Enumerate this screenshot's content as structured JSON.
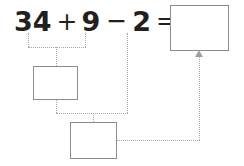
{
  "worksheet": {
    "title": "Number bond decomposition worksheet",
    "equation": {
      "term1": "34",
      "op1": "+",
      "term2": "9",
      "op2": "−",
      "term3": "2",
      "op3": "=",
      "full_text": "34 + 9 − 2 ="
    },
    "boxes": [
      {
        "id": "box-answer",
        "role": "final-answer",
        "value": "",
        "placeholder": ""
      },
      {
        "id": "box-mid",
        "role": "partial-sum-34-plus-9",
        "value": "",
        "placeholder": ""
      },
      {
        "id": "box-bottom",
        "role": "partial-result-minus-2",
        "value": "",
        "placeholder": ""
      }
    ],
    "connectors": [
      {
        "id": "lead-34",
        "from": "term-34",
        "to": "join-top"
      },
      {
        "id": "lead-9",
        "from": "term-9",
        "to": "join-top"
      },
      {
        "id": "join-top",
        "from": "lead-34",
        "to": "lead-9"
      },
      {
        "id": "into-mid",
        "from": "join-top",
        "to": "box-mid"
      },
      {
        "id": "lead-2",
        "from": "term-2",
        "to": "join-mid"
      },
      {
        "id": "mid-down",
        "from": "box-mid",
        "to": "join-mid"
      },
      {
        "id": "join-mid",
        "from": "mid-down",
        "to": "lead-2"
      },
      {
        "id": "into-bottom",
        "from": "join-mid",
        "to": "box-bottom"
      },
      {
        "id": "out-bottom",
        "from": "box-bottom",
        "to": "riser"
      },
      {
        "id": "riser",
        "from": "out-bottom",
        "to": "box-answer"
      }
    ],
    "colors": {
      "text": "#231f20",
      "box_border": "#8d8d90",
      "connector": "#a8a8ab",
      "arrow": "#a0a0a3",
      "background": "#ffffff"
    }
  }
}
